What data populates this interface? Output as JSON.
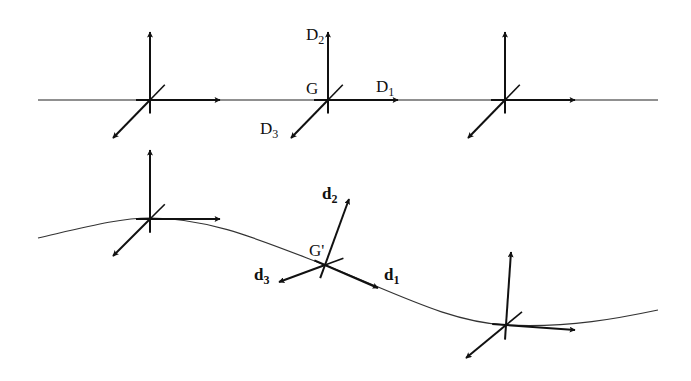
{
  "diagram": {
    "colors": {
      "line": "#111111",
      "background": "#ffffff"
    },
    "reference": {
      "line": {
        "x1": 38,
        "y1": 100,
        "x2": 658,
        "y2": 100
      },
      "origin_label": "G",
      "frames": [
        {
          "o": [
            150,
            100
          ],
          "e2": [
            150,
            32
          ],
          "e1": [
            220,
            100
          ],
          "e3": [
            113,
            138
          ]
        },
        {
          "o": [
            328,
            100
          ],
          "e2": [
            328,
            32
          ],
          "e1": [
            398,
            100
          ],
          "e3": [
            291,
            138
          ]
        },
        {
          "o": [
            505,
            100
          ],
          "e2": [
            505,
            32
          ],
          "e1": [
            575,
            100
          ],
          "e3": [
            468,
            138
          ]
        }
      ],
      "labels": {
        "d1": "D",
        "d1_sub": "1",
        "d2": "D",
        "d2_sub": "2",
        "d3": "D",
        "d3_sub": "3"
      }
    },
    "deformed": {
      "curve": "M38,238 C90,226 120,218 150,218 C210,218 260,240 325,265 C400,295 450,322 506,325 C570,328 620,318 658,310",
      "origin_label": "G'",
      "frames": [
        {
          "o": [
            150,
            219
          ],
          "e2": [
            150,
            150
          ],
          "e1": [
            220,
            219
          ],
          "e3": [
            113,
            256
          ]
        },
        {
          "o": [
            325,
            265
          ],
          "e2": [
            349,
            199
          ],
          "e1": [
            378,
            288
          ],
          "e3": [
            279,
            282
          ]
        },
        {
          "o": [
            506,
            325
          ],
          "e2": [
            511,
            252
          ],
          "e1": [
            575,
            330
          ],
          "e3": [
            466,
            358
          ]
        }
      ],
      "labels": {
        "d1": "d",
        "d1_sub": "1",
        "d2": "d",
        "d2_sub": "2",
        "d3": "d",
        "d3_sub": "3"
      }
    }
  }
}
